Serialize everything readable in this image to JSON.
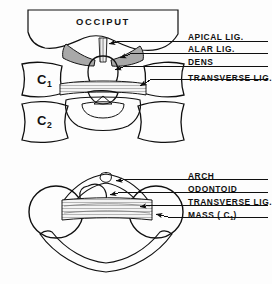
{
  "figure": {
    "background_color": "#fdfdfd",
    "ink_color": "#111111",
    "fill_tone_color": "#8a8a8a"
  },
  "panels": [
    {
      "id": "coronal-view",
      "name": "Coronal section through occiput, C1 and C2",
      "occiput_label": "OCCIPUT",
      "vertebra_labels": [
        {
          "text": "C",
          "subscript": "1"
        },
        {
          "text": "C",
          "subscript": "2"
        }
      ],
      "labels": [
        {
          "text": "APICAL LIG.",
          "target": "apical-ligament"
        },
        {
          "text": "ALAR LIG.",
          "target": "alar-ligament"
        },
        {
          "text": "DENS",
          "target": "dens"
        },
        {
          "text": "TRANSVERSE LIG.",
          "target": "transverse-ligament"
        }
      ]
    },
    {
      "id": "axial-view",
      "name": "Axial view of C1 ring with odontoid",
      "labels": [
        {
          "text": "ARCH",
          "target": "anterior-arch"
        },
        {
          "text": "ODONTOID",
          "target": "odontoid-process"
        },
        {
          "text": "TRANSVERSE LIG.",
          "target": "transverse-ligament"
        },
        {
          "text": "MASS (",
          "subscript": "1",
          "suffix": ")",
          "prefix_c": "C",
          "target": "lateral-mass"
        }
      ]
    }
  ],
  "label_text": {
    "apical": "APICAL LIG.",
    "alar": "ALAR LIG.",
    "dens": "DENS",
    "transverse_top": "TRANSVERSE LIG.",
    "arch": "ARCH",
    "odontoid": "ODONTOID",
    "transverse_bottom": "TRANSVERSE LIG.",
    "mass_pre": "MASS ( C",
    "mass_sub": "1",
    "mass_post": ")",
    "occiput": "OCCIPUT",
    "c1_main": "C",
    "c1_sub": "1",
    "c2_main": "C",
    "c2_sub": "2"
  }
}
